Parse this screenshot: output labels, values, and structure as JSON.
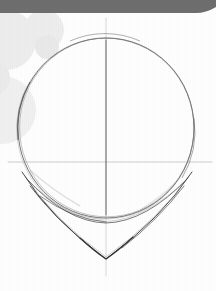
{
  "page": {
    "width": 216,
    "height": 291,
    "background_color": "#fefefe",
    "paper_color": "#ffffff"
  },
  "header_bar": {
    "name": "header-bar",
    "color": "#6e6e6e",
    "x": 0,
    "y": 0,
    "width": 216,
    "height": 13,
    "right_corner_style": "rounded-taper"
  },
  "decorations": {
    "circle_color": "#ededed",
    "circle_color_light": "#f2f2f2",
    "circles": [
      {
        "name": "decor-circle-large-left",
        "cx": 6,
        "cy": 40,
        "r": 30
      },
      {
        "name": "decor-circle-medium-top",
        "cx": 44,
        "cy": 30,
        "r": 20
      },
      {
        "name": "decor-circle-small-mid",
        "cx": 47,
        "cy": 47,
        "r": 12
      },
      {
        "name": "decor-circle-large-lower-left",
        "cx": 2,
        "cy": 110,
        "r": 34
      },
      {
        "name": "decor-circle-edge-left",
        "cx": -8,
        "cy": 78,
        "r": 18
      }
    ]
  },
  "sketch": {
    "title": "head-construction-guide",
    "pencil_color": "#3a3a3a",
    "guideline_color": "#b8b8b8",
    "cranium_circle": {
      "name": "cranium-circle",
      "cx": 106,
      "cy": 128,
      "rx": 88,
      "ry": 90,
      "top_y": 38,
      "bottom_y": 218,
      "left_x": 18,
      "right_x": 194
    },
    "vertical_center_line": {
      "name": "vertical-center-guideline",
      "x": 106,
      "y_start": 18,
      "y_end": 276
    },
    "horizontal_eye_line": {
      "name": "horizontal-eye-guideline",
      "y": 162,
      "x_start": 8,
      "x_end": 212
    },
    "jaw_shallow_arc": {
      "name": "jaw-shallow-arc",
      "left_x": 26,
      "left_y": 178,
      "right_x": 188,
      "right_y": 178,
      "bottom_x": 106,
      "bottom_y": 223
    },
    "chin_v_line": {
      "name": "chin-jaw-v-line",
      "left_x": 22,
      "left_y": 172,
      "right_x": 192,
      "right_y": 172,
      "apex_x": 106,
      "apex_y": 259
    }
  }
}
